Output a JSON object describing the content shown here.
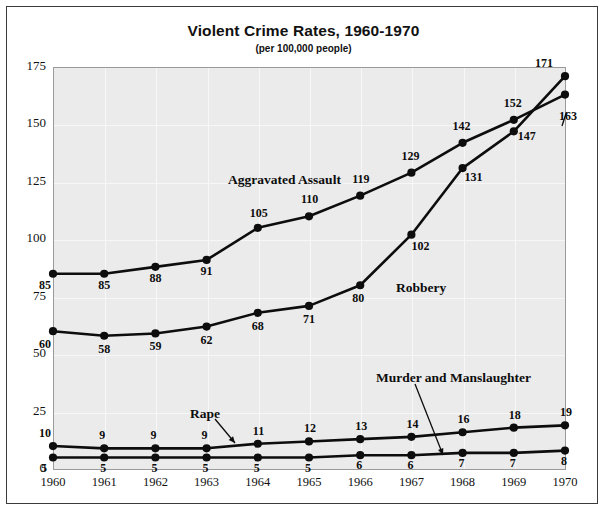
{
  "chart_data": {
    "type": "line",
    "title": "Violent Crime Rates, 1960-1970",
    "subtitle": "(per 100,000 people)",
    "xlabel": "",
    "ylabel": "",
    "grid": true,
    "legend_position": "inline-annotations",
    "ylim": [
      0,
      175
    ],
    "yticks": [
      0,
      25,
      50,
      75,
      100,
      125,
      150,
      175
    ],
    "ytick_labels": [
      "0",
      "25",
      "50",
      "75",
      "100",
      "125",
      "150",
      "175"
    ],
    "categories": [
      1960,
      1961,
      1962,
      1963,
      1964,
      1965,
      1966,
      1967,
      1968,
      1969,
      1970
    ],
    "xtick_labels": [
      "1960",
      "1961",
      "1962",
      "1963",
      "1964",
      "1965",
      "1966",
      "1967",
      "1968",
      "1969",
      "1970"
    ],
    "series": [
      {
        "name": "Robbery",
        "values": [
          60,
          58,
          59,
          62,
          68,
          71,
          80,
          102,
          131,
          147,
          171
        ],
        "color": "#0d0d0d"
      },
      {
        "name": "Aggravated Assault",
        "values": [
          85,
          85,
          88,
          91,
          105,
          110,
          119,
          129,
          142,
          152,
          163
        ],
        "color": "#0d0d0d"
      },
      {
        "name": "Rape",
        "values": [
          10,
          9,
          9,
          9,
          11,
          12,
          13,
          14,
          16,
          18,
          19
        ],
        "color": "#0d0d0d"
      },
      {
        "name": "Murder and Manslaughter",
        "values": [
          5,
          5,
          5,
          5,
          5,
          5,
          6,
          6,
          7,
          7,
          8
        ],
        "color": "#0d0d0d"
      }
    ]
  },
  "annotations": {
    "aggravated_assault_label": "Aggravated Assault",
    "robbery_label": "Robbery",
    "rape_label": "Rape",
    "murder_label": "Murder and Manslaughter"
  },
  "colors": {
    "plot_background": "#ebebeb",
    "gridline": "#f7f7f7",
    "line": "#0d0d0d",
    "frame": "#3b3b3b",
    "axis": "#9a9a9a",
    "text": "#111111"
  }
}
